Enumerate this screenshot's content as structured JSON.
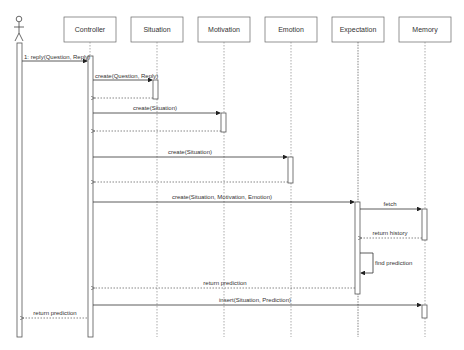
{
  "diagram": {
    "type": "uml-sequence",
    "actor": {
      "name": "",
      "x": 19
    },
    "lifelines": [
      {
        "name": "Controller",
        "x": 89
      },
      {
        "name": "Situation",
        "x": 157
      },
      {
        "name": "Motivation",
        "x": 223
      },
      {
        "name": "Emotion",
        "x": 290
      },
      {
        "name": "Expectation",
        "x": 358
      },
      {
        "name": "Memory",
        "x": 425
      }
    ],
    "messages": [
      {
        "label": "1: reply(Question, Reply)",
        "from": "Actor",
        "to": "Controller",
        "kind": "sync"
      },
      {
        "label": "create(Question, Reply)",
        "from": "Controller",
        "to": "Situation",
        "kind": "sync"
      },
      {
        "label": "",
        "from": "Situation",
        "to": "Controller",
        "kind": "return"
      },
      {
        "label": "create(Situation)",
        "from": "Controller",
        "to": "Motivation",
        "kind": "sync"
      },
      {
        "label": "",
        "from": "Motivation",
        "to": "Controller",
        "kind": "return"
      },
      {
        "label": "create(Situation)",
        "from": "Controller",
        "to": "Emotion",
        "kind": "sync"
      },
      {
        "label": "",
        "from": "Emotion",
        "to": "Controller",
        "kind": "return"
      },
      {
        "label": "create(Situation, Motivation, Emotion)",
        "from": "Controller",
        "to": "Expectation",
        "kind": "sync"
      },
      {
        "label": "fetch",
        "from": "Expectation",
        "to": "Memory",
        "kind": "sync"
      },
      {
        "label": "return history",
        "from": "Memory",
        "to": "Expectation",
        "kind": "return"
      },
      {
        "label": "find prediction",
        "from": "Expectation",
        "to": "Expectation",
        "kind": "self"
      },
      {
        "label": "return prediction",
        "from": "Expectation",
        "to": "Controller",
        "kind": "return"
      },
      {
        "label": "insert(Situation, Prediction)",
        "from": "Controller",
        "to": "Memory",
        "kind": "sync"
      },
      {
        "label": "return prediction",
        "from": "Controller",
        "to": "Actor",
        "kind": "return"
      }
    ]
  }
}
